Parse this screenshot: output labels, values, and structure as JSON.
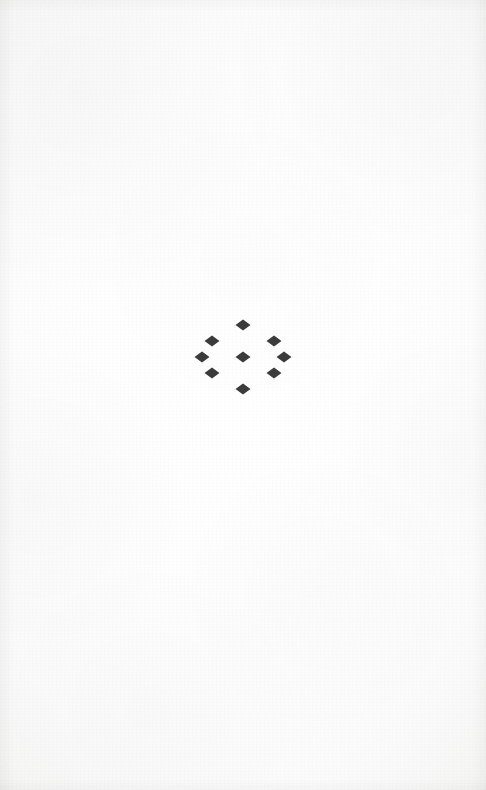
{
  "page": {
    "kind": "printed-book-page",
    "width": 486,
    "height": 790,
    "paper_color": "#fdfdfd",
    "text_content": "",
    "notes_visible_text": "none"
  },
  "ornament": {
    "name": "diamond-lattice-ornament",
    "description": "nine solid diamonds arranged in a three-by-three lattice rotated forty-five degrees",
    "ink_color": "#3b3b3b",
    "count": 9,
    "rows": 3,
    "columns": 3,
    "center_x": 240,
    "center_y": 357,
    "diamond_width": 15,
    "diamond_height": 11,
    "step_x": 31,
    "step_y": 16,
    "diamonds": [
      {
        "id": "diamond-1",
        "row": 0,
        "col": 0,
        "cx": 209,
        "cy": 341
      },
      {
        "id": "diamond-2",
        "row": 0,
        "col": 1,
        "cx": 240,
        "cy": 325
      },
      {
        "id": "diamond-3",
        "row": 0,
        "col": 2,
        "cx": 271,
        "cy": 341
      },
      {
        "id": "diamond-4",
        "row": 1,
        "col": 0,
        "cx": 199,
        "cy": 357
      },
      {
        "id": "diamond-5",
        "row": 1,
        "col": 1,
        "cx": 240,
        "cy": 357
      },
      {
        "id": "diamond-6",
        "row": 1,
        "col": 2,
        "cx": 281,
        "cy": 357
      },
      {
        "id": "diamond-7",
        "row": 2,
        "col": 0,
        "cx": 209,
        "cy": 373
      },
      {
        "id": "diamond-8",
        "row": 2,
        "col": 1,
        "cx": 240,
        "cy": 389
      },
      {
        "id": "diamond-9",
        "row": 2,
        "col": 2,
        "cx": 271,
        "cy": 373
      }
    ]
  }
}
